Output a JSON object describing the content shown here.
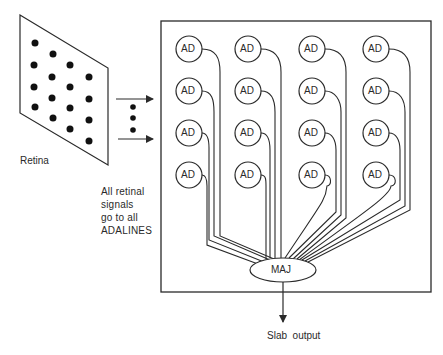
{
  "diagram": {
    "retina": {
      "label": "Retina",
      "dot_count": 16
    },
    "note": {
      "lines": [
        "All  retinal",
        "signals",
        "go to all",
        "ADALINES"
      ]
    },
    "slab": {
      "adaline_label": "AD",
      "columns": 4,
      "rows": 4,
      "majority_label": "MAJ"
    },
    "output": {
      "label": "Slab  output"
    },
    "colors": {
      "stroke": "#2a2a2a",
      "background": "#ffffff"
    }
  }
}
